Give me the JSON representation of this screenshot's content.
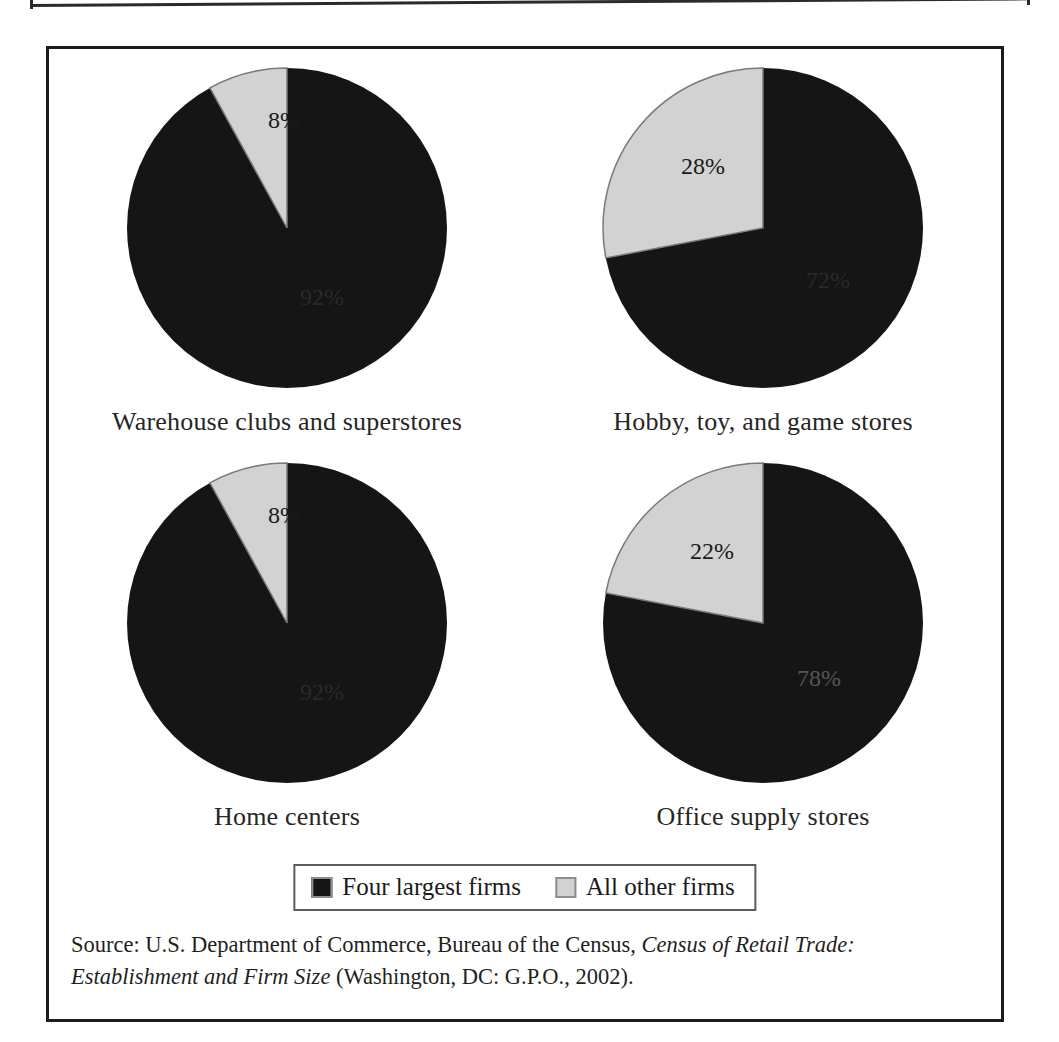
{
  "figure": {
    "legend": {
      "items": [
        {
          "key": "four-largest",
          "label": "Four largest firms",
          "color": "#151515"
        },
        {
          "key": "all-other",
          "label": "All other firms",
          "color": "#d2d2d2"
        }
      ]
    },
    "source_note": {
      "prefix": "Source: U.S. Department of Commerce, Bureau of the Census, ",
      "title_italic": "Census of Retail Trade: Establishment and Firm Size",
      "suffix": " (Washington, DC: G.P.O., 2002)."
    }
  },
  "chart_data": [
    {
      "type": "pie",
      "title": "Warehouse clubs and superstores",
      "labels": [
        "Four largest firms",
        "All other firms"
      ],
      "values": [
        92,
        8
      ],
      "value_labels": [
        "92%",
        "8%"
      ],
      "colors": [
        "#151515",
        "#d2d2d2"
      ],
      "start_angle_deg": 0,
      "direction": "counterclockwise",
      "units": "percent"
    },
    {
      "type": "pie",
      "title": "Hobby, toy, and game stores",
      "labels": [
        "Four largest firms",
        "All other firms"
      ],
      "values": [
        72,
        28
      ],
      "value_labels": [
        "72%",
        "28%"
      ],
      "colors": [
        "#151515",
        "#d2d2d2"
      ],
      "start_angle_deg": 0,
      "direction": "counterclockwise",
      "units": "percent"
    },
    {
      "type": "pie",
      "title": "Home centers",
      "labels": [
        "Four largest firms",
        "All other firms"
      ],
      "values": [
        92,
        8
      ],
      "value_labels": [
        "92%",
        "8%"
      ],
      "colors": [
        "#151515",
        "#d2d2d2"
      ],
      "start_angle_deg": 0,
      "direction": "counterclockwise",
      "units": "percent"
    },
    {
      "type": "pie",
      "title": "Office supply stores",
      "labels": [
        "Four largest firms",
        "All other firms"
      ],
      "values": [
        78,
        22
      ],
      "value_labels": [
        "78%",
        "22%"
      ],
      "colors": [
        "#151515",
        "#d2d2d2"
      ],
      "start_angle_deg": 0,
      "direction": "counterclockwise",
      "units": "percent"
    }
  ]
}
